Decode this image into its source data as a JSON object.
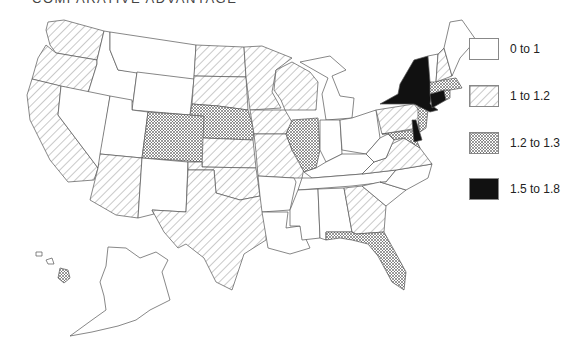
{
  "title": "COMPARATIVE ADVANTAGE",
  "legend": {
    "items": [
      {
        "label": "0 to 1",
        "pattern": "white"
      },
      {
        "label": "1 to 1.2",
        "pattern": "hatch"
      },
      {
        "label": "1.2 to 1.3",
        "pattern": "crosshatch"
      },
      {
        "label": "1.5 to 1.8",
        "pattern": "black"
      }
    ]
  },
  "colors": {
    "stroke": "#555555",
    "hatch": "#777777",
    "black": "#111111",
    "background": "#ffffff"
  },
  "states": {
    "white": [
      "ID",
      "MT",
      "WY",
      "NV",
      "UT",
      "NM",
      "MI",
      "IN",
      "OH",
      "WV",
      "KY",
      "TN",
      "NC",
      "SC",
      "AL",
      "MS",
      "LA",
      "AR",
      "ME",
      "VT",
      "AK"
    ],
    "hatch": [
      "WA",
      "OR",
      "CA",
      "AZ",
      "ND",
      "SD",
      "MN",
      "WI",
      "IA",
      "KS",
      "MO",
      "OK",
      "TX",
      "PA",
      "VA",
      "GA",
      "NH"
    ],
    "crosshatch": [
      "CO",
      "NE",
      "IL",
      "MA",
      "RI",
      "NJ",
      "MD",
      "FL",
      "HI"
    ],
    "black": [
      "NY",
      "CT",
      "DE"
    ]
  }
}
